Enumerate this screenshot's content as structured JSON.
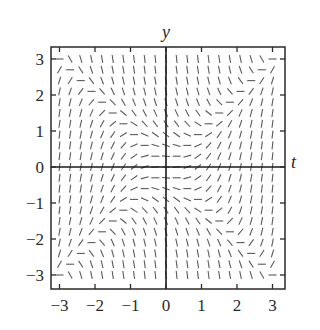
{
  "diagram": {
    "type": "slope_field",
    "equation": "dy/dt = t^2 - y^2",
    "axes": {
      "x_label": "t",
      "y_label": "y",
      "x_range": [
        -3.25,
        3.35
      ],
      "y_range": [
        -3.35,
        3.35
      ],
      "x_ticks": [
        -3,
        -2,
        -1,
        0,
        1,
        2,
        3
      ],
      "y_ticks": [
        3,
        2,
        1,
        0,
        -1,
        -2,
        -3
      ],
      "x_tick_labels": [
        "−3",
        "−2",
        "−1",
        "0",
        "1",
        "2",
        "3"
      ],
      "y_tick_labels": [
        "3",
        "2",
        "1",
        "0",
        "−1",
        "−2",
        "−3"
      ]
    },
    "grid": {
      "t_min": -3.0,
      "t_max": 3.0,
      "y_min": -3.0,
      "y_max": 3.0,
      "step": 0.3
    },
    "colors": {
      "frame": "#2a2a2a",
      "segment": "#5a5a5a",
      "axis": "#1a1a1a"
    }
  }
}
